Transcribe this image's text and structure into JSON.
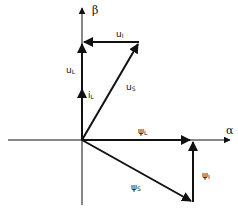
{
  "diagram": {
    "type": "vector-diagram",
    "axes": {
      "horizontal": {
        "label": "α"
      },
      "vertical": {
        "label": "β"
      }
    },
    "origin": [
      82,
      140
    ],
    "vectors": [
      {
        "id": "u_L",
        "base": "u",
        "sub": "L",
        "from": [
          82,
          140
        ],
        "to": [
          82,
          42
        ]
      },
      {
        "id": "i_L",
        "base": "i",
        "sub": "L",
        "from": [
          82,
          140
        ],
        "to": [
          82,
          87
        ]
      },
      {
        "id": "u_S",
        "base": "u",
        "sub": "S",
        "from": [
          82,
          140
        ],
        "to": [
          139,
          42
        ]
      },
      {
        "id": "u_I",
        "base": "u",
        "sub": "I",
        "from": [
          139,
          42
        ],
        "to": [
          82,
          42
        ]
      },
      {
        "id": "psi_L",
        "base": "ψ",
        "sub": "L",
        "from": [
          82,
          140
        ],
        "to": [
          193,
          140
        ]
      },
      {
        "id": "psi_S",
        "base": "ψ",
        "sub": "S",
        "from": [
          82,
          140
        ],
        "to": [
          193,
          202
        ]
      },
      {
        "id": "psi_I",
        "base": "ψ",
        "sub": "I",
        "from": [
          193,
          202
        ],
        "to": [
          193,
          140
        ]
      }
    ],
    "labels": {
      "alpha": "α",
      "beta": "β",
      "u_L": {
        "base": "u",
        "sub": "L"
      },
      "i_L": {
        "base": "i",
        "sub": "L"
      },
      "u_S": {
        "base": "u",
        "sub": "S"
      },
      "u_I": {
        "base": "u",
        "sub": "I"
      },
      "psi_L": {
        "base": "ψ",
        "sub": "L"
      },
      "psi_S": {
        "base": "ψ",
        "sub": "S"
      },
      "psi_I": {
        "base": "ψ",
        "sub": "I"
      }
    }
  }
}
